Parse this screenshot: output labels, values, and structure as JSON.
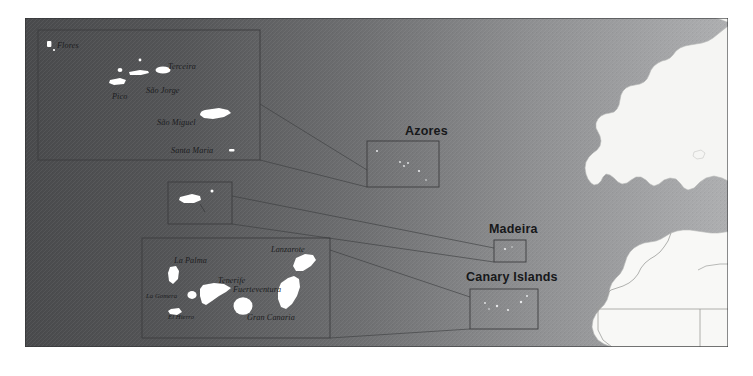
{
  "map": {
    "title": "Macaronesia reference map",
    "frame": {
      "x": 25,
      "y": 18,
      "width": 703,
      "height": 329
    },
    "colors": {
      "ocean_dark": "#4e4f51",
      "ocean_light": "#9a9b9d",
      "land": "#f4f4f2",
      "island": "#ffffff",
      "border_line": "#3a3b3d",
      "inset_box": "#3c3d3f",
      "page_background": "#ffffff",
      "label_text": "#17181a"
    },
    "ocean_gradient": {
      "direction": "left-to-right",
      "from": "#4e4f51",
      "to": "#a8a9ab"
    }
  },
  "region_labels": [
    {
      "name": "azores-region-label",
      "text": "Azores",
      "x": 405,
      "y": 131
    },
    {
      "name": "madeira-region-label",
      "text": "Madeira",
      "x": 489,
      "y": 229
    },
    {
      "name": "canary-region-label",
      "text": "Canary Islands",
      "x": 503,
      "y": 277
    }
  ],
  "insets": [
    {
      "name": "azores-detail-inset",
      "region": "Azores",
      "box": {
        "x": 38,
        "y": 30,
        "width": 222,
        "height": 130
      },
      "target_box": {
        "x": 367,
        "y": 141,
        "width": 72,
        "height": 46
      }
    },
    {
      "name": "madeira-detail-inset",
      "region": "Madeira",
      "box": {
        "x": 168,
        "y": 182,
        "width": 64,
        "height": 42
      },
      "target_box": {
        "x": 494,
        "y": 240,
        "width": 32,
        "height": 22
      }
    },
    {
      "name": "canary-detail-inset",
      "region": "Canary Islands",
      "box": {
        "x": 142,
        "y": 238,
        "width": 188,
        "height": 100
      },
      "target_box": {
        "x": 470,
        "y": 289,
        "width": 68,
        "height": 40
      }
    }
  ],
  "islands": {
    "azores": [
      {
        "name": "flores-label",
        "text": "Flores",
        "x": 57,
        "y": 45
      },
      {
        "name": "terceira-label",
        "text": "Terceira",
        "x": 168,
        "y": 66
      },
      {
        "name": "sao-jorge-label",
        "text": "São Jorge",
        "x": 145,
        "y": 90
      },
      {
        "name": "pico-label",
        "text": "Pico",
        "x": 113,
        "y": 96
      },
      {
        "name": "sao-miguel-label",
        "text": "São Miguel",
        "x": 157,
        "y": 122
      },
      {
        "name": "santa-maria-label",
        "text": "Santa Maria",
        "x": 172,
        "y": 150
      }
    ],
    "canaries": [
      {
        "name": "la-palma-label",
        "text": "La Palma",
        "x": 175,
        "y": 261
      },
      {
        "name": "tenerife-label",
        "text": "Tenerife",
        "x": 219,
        "y": 281
      },
      {
        "name": "la-gomera-label",
        "text": "La Gomera",
        "x": 148,
        "y": 297
      },
      {
        "name": "el-hierro-label",
        "text": "El Hierro",
        "x": 167,
        "y": 317
      },
      {
        "name": "gran-canaria-label",
        "text": "Gran Canaria",
        "x": 248,
        "y": 318
      },
      {
        "name": "fuerteventura-label",
        "text": "Fuerteventura",
        "x": 234,
        "y": 290
      },
      {
        "name": "lanzarote-label",
        "text": "Lanzarote",
        "x": 272,
        "y": 250
      }
    ]
  }
}
